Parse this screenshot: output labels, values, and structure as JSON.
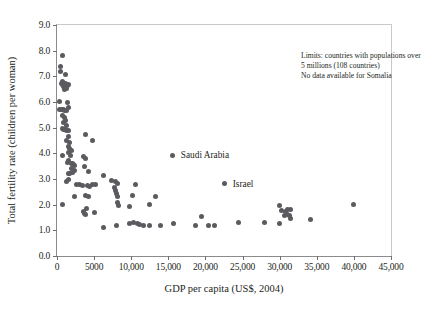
{
  "chart_data": {
    "type": "scatter",
    "title": "",
    "xlabel": "GDP per capita (US$, 2004)",
    "ylabel": "Total fertility rate (children per woman)",
    "xlim": [
      0,
      45000
    ],
    "ylim": [
      0,
      9.0
    ],
    "grid": false,
    "legend": "none",
    "marker_color": "#5b5b5f",
    "xticks": [
      0,
      5000,
      10000,
      15000,
      20000,
      25000,
      30000,
      35000,
      40000,
      45000
    ],
    "xticklabels": [
      "0",
      "5000",
      "10,000",
      "15,000",
      "20,000",
      "25,000",
      "30,000",
      "35,000",
      "40,000",
      "45,000"
    ],
    "yticks": [
      0.0,
      1.0,
      2.0,
      3.0,
      4.0,
      5.0,
      6.0,
      7.0,
      8.0,
      9.0
    ],
    "yticklabels": [
      "0.0",
      "1.0",
      "2.0",
      "3.0",
      "4.0",
      "5.0",
      "6.0",
      "7.0",
      "8.0",
      "9.0"
    ],
    "annotations": [
      {
        "id": "note",
        "lines": [
          "Limits: countries with populations over",
          "5 millions (108 countries)",
          "No data available for Somalia"
        ]
      }
    ],
    "labeled_points": [
      {
        "label": "Saudi Arabia",
        "x": 15600,
        "y": 3.93
      },
      {
        "label": "Israel",
        "x": 22600,
        "y": 2.82
      }
    ],
    "points": [
      [
        700,
        7.82
      ],
      [
        450,
        7.38
      ],
      [
        500,
        7.18
      ],
      [
        1100,
        7.08
      ],
      [
        600,
        6.72
      ],
      [
        700,
        6.78
      ],
      [
        800,
        6.68
      ],
      [
        900,
        6.62
      ],
      [
        1000,
        6.7
      ],
      [
        1150,
        6.72
      ],
      [
        1250,
        6.68
      ],
      [
        1350,
        6.64
      ],
      [
        1500,
        6.7
      ],
      [
        1250,
        6.52
      ],
      [
        1000,
        6.5
      ],
      [
        350,
        6.02
      ],
      [
        1400,
        6.0
      ],
      [
        1500,
        5.8
      ],
      [
        400,
        5.72
      ],
      [
        550,
        5.7
      ],
      [
        700,
        5.72
      ],
      [
        900,
        5.7
      ],
      [
        1050,
        5.68
      ],
      [
        1250,
        5.66
      ],
      [
        800,
        5.48
      ],
      [
        1000,
        5.4
      ],
      [
        1150,
        5.28
      ],
      [
        900,
        5.2
      ],
      [
        1300,
        5.1
      ],
      [
        700,
        4.98
      ],
      [
        900,
        4.94
      ],
      [
        1100,
        4.92
      ],
      [
        1300,
        4.88
      ],
      [
        1500,
        4.9
      ],
      [
        3900,
        4.72
      ],
      [
        4800,
        4.5
      ],
      [
        1500,
        4.64
      ],
      [
        1300,
        4.5
      ],
      [
        1700,
        4.42
      ],
      [
        1600,
        4.28
      ],
      [
        1750,
        4.18
      ],
      [
        1900,
        4.1
      ],
      [
        1500,
        4.02
      ],
      [
        700,
        3.92
      ],
      [
        1800,
        3.9
      ],
      [
        3600,
        3.88
      ],
      [
        3900,
        3.78
      ],
      [
        1600,
        3.72
      ],
      [
        1450,
        3.64
      ],
      [
        1900,
        3.62
      ],
      [
        2050,
        3.6
      ],
      [
        2200,
        3.56
      ],
      [
        2400,
        3.52
      ],
      [
        3700,
        3.48
      ],
      [
        2000,
        3.4
      ],
      [
        2300,
        3.34
      ],
      [
        2150,
        3.26
      ],
      [
        1500,
        3.22
      ],
      [
        1700,
        3.2
      ],
      [
        4200,
        3.28
      ],
      [
        6200,
        3.12
      ],
      [
        1550,
        2.98
      ],
      [
        1300,
        2.9
      ],
      [
        7400,
        2.96
      ],
      [
        7900,
        2.9
      ],
      [
        2600,
        2.8
      ],
      [
        3000,
        2.78
      ],
      [
        3500,
        2.74
      ],
      [
        4100,
        2.76
      ],
      [
        4400,
        2.72
      ],
      [
        4800,
        2.8
      ],
      [
        5200,
        2.78
      ],
      [
        8200,
        2.82
      ],
      [
        10600,
        2.8
      ],
      [
        7700,
        2.68
      ],
      [
        7900,
        2.56
      ],
      [
        8000,
        2.42
      ],
      [
        8100,
        2.3
      ],
      [
        10200,
        2.34
      ],
      [
        13300,
        2.3
      ],
      [
        2300,
        2.3
      ],
      [
        3800,
        2.34
      ],
      [
        4300,
        2.32
      ],
      [
        800,
        2.0
      ],
      [
        8200,
        2.08
      ],
      [
        8300,
        1.96
      ],
      [
        9800,
        1.92
      ],
      [
        12500,
        2.0
      ],
      [
        4000,
        1.84
      ],
      [
        3600,
        1.72
      ],
      [
        3700,
        1.64
      ],
      [
        3900,
        1.6
      ],
      [
        5000,
        1.7
      ],
      [
        19500,
        1.52
      ],
      [
        30000,
        1.95
      ],
      [
        30200,
        1.78
      ],
      [
        30800,
        1.74
      ],
      [
        31100,
        1.8
      ],
      [
        31400,
        1.82
      ],
      [
        31000,
        1.62
      ],
      [
        31300,
        1.56
      ],
      [
        30700,
        1.58
      ],
      [
        31500,
        1.46
      ],
      [
        34100,
        1.42
      ],
      [
        39900,
        2.0
      ],
      [
        6200,
        1.12
      ],
      [
        8000,
        1.2
      ],
      [
        9800,
        1.28
      ],
      [
        10300,
        1.3
      ],
      [
        10800,
        1.28
      ],
      [
        11100,
        1.22
      ],
      [
        11700,
        1.2
      ],
      [
        12500,
        1.2
      ],
      [
        14000,
        1.2
      ],
      [
        15700,
        1.28
      ],
      [
        18600,
        1.2
      ],
      [
        20400,
        1.2
      ],
      [
        21200,
        1.2
      ],
      [
        24400,
        1.3
      ],
      [
        27900,
        1.3
      ],
      [
        30000,
        1.28
      ]
    ]
  }
}
